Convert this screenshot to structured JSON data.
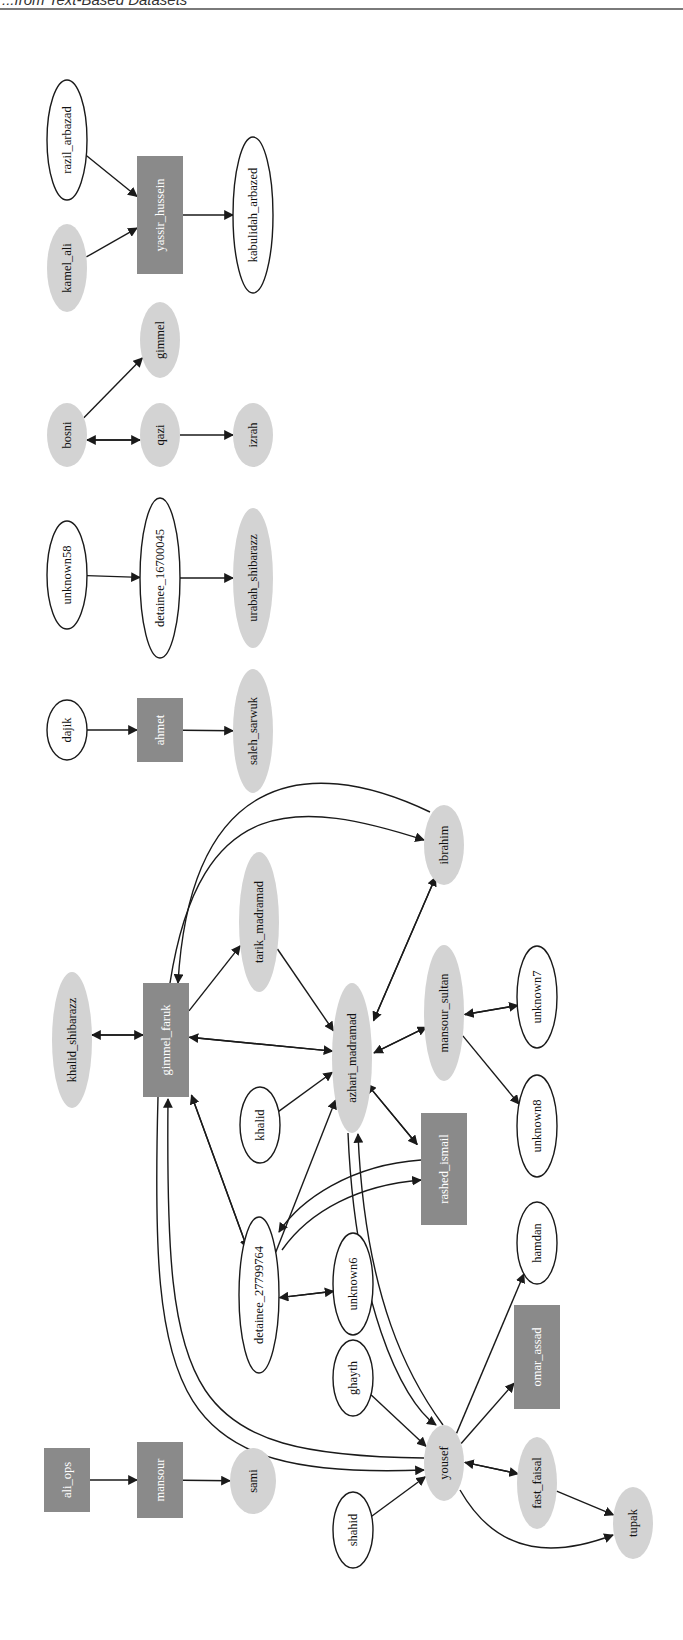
{
  "header": {
    "title": "...from Text-Based Datasets"
  },
  "colors": {
    "box_fill": "#8a8a8a",
    "box_text": "#ffffff",
    "gray_ellipse_fill": "#d3d3d3",
    "white_ellipse_fill": "#ffffff",
    "stroke": "#1a1a1a",
    "text": "#111111"
  },
  "graph": {
    "orientation": "rotated-90-ccw",
    "node_shapes_legend": {
      "box": "dark gray rectangle, white label",
      "gray": "light gray filled ellipse",
      "white": "white ellipse with black outline"
    },
    "nodes": [
      {
        "id": "ali_ops",
        "label": "ali_ops",
        "shape": "box",
        "x": 67,
        "y": 1480,
        "w": 46,
        "h": 64
      },
      {
        "id": "mansour",
        "label": "mansour",
        "shape": "box",
        "x": 160,
        "y": 1480,
        "w": 46,
        "h": 76
      },
      {
        "id": "sami",
        "label": "sami",
        "shape": "gray",
        "x": 253,
        "y": 1481,
        "rx": 23,
        "ry": 33
      },
      {
        "id": "shahid",
        "label": "shahid",
        "shape": "white",
        "x": 353,
        "y": 1530,
        "rx": 20,
        "ry": 38
      },
      {
        "id": "ghayth",
        "label": "ghayth",
        "shape": "white",
        "x": 353,
        "y": 1378,
        "rx": 20,
        "ry": 38
      },
      {
        "id": "yousef",
        "label": "yousef",
        "shape": "gray",
        "x": 444,
        "y": 1463,
        "rx": 20,
        "ry": 38
      },
      {
        "id": "fast_faisal",
        "label": "fast_faisal",
        "shape": "gray",
        "x": 537,
        "y": 1483,
        "rx": 20,
        "ry": 46
      },
      {
        "id": "tupak",
        "label": "tupak",
        "shape": "gray",
        "x": 633,
        "y": 1523,
        "rx": 20,
        "ry": 36
      },
      {
        "id": "omar_assad",
        "label": "omar_assad",
        "shape": "box",
        "x": 537,
        "y": 1357,
        "w": 46,
        "h": 104
      },
      {
        "id": "hamdan",
        "label": "hamdan",
        "shape": "white",
        "x": 537,
        "y": 1243,
        "rx": 20,
        "ry": 41
      },
      {
        "id": "detainee_27799764",
        "label": "detainee_27799764",
        "shape": "white",
        "x": 259,
        "y": 1295,
        "rx": 20,
        "ry": 78
      },
      {
        "id": "unknown6",
        "label": "unknown6",
        "shape": "white",
        "x": 353,
        "y": 1284,
        "rx": 20,
        "ry": 51
      },
      {
        "id": "khalid",
        "label": "khalid",
        "shape": "white",
        "x": 260,
        "y": 1125,
        "rx": 20,
        "ry": 38
      },
      {
        "id": "azhari_madramad",
        "label": "azhari_madramad",
        "shape": "gray",
        "x": 352,
        "y": 1058,
        "rx": 20,
        "ry": 75
      },
      {
        "id": "rashed_ismail",
        "label": "rashed_ismail",
        "shape": "box",
        "x": 444,
        "y": 1169,
        "w": 46,
        "h": 112
      },
      {
        "id": "mansour_sultan",
        "label": "mansour_sultan",
        "shape": "gray",
        "x": 444,
        "y": 1013,
        "rx": 20,
        "ry": 68
      },
      {
        "id": "unknown7",
        "label": "unknown7",
        "shape": "white",
        "x": 537,
        "y": 997,
        "rx": 20,
        "ry": 51
      },
      {
        "id": "unknown8",
        "label": "unknown8",
        "shape": "white",
        "x": 537,
        "y": 1126,
        "rx": 20,
        "ry": 51
      },
      {
        "id": "ibrahim",
        "label": "ibrahim",
        "shape": "gray",
        "x": 444,
        "y": 845,
        "rx": 20,
        "ry": 40
      },
      {
        "id": "tarik_madramad",
        "label": "tarik_madramad",
        "shape": "gray",
        "x": 259,
        "y": 922,
        "rx": 20,
        "ry": 70
      },
      {
        "id": "gimmel_faruk",
        "label": "gimmel_faruk",
        "shape": "box",
        "x": 166,
        "y": 1040,
        "w": 46,
        "h": 114
      },
      {
        "id": "khalid_shibarazz",
        "label": "khalid_shibarazz",
        "shape": "gray",
        "x": 72,
        "y": 1040,
        "rx": 20,
        "ry": 68
      },
      {
        "id": "dajik",
        "label": "dajik",
        "shape": "white",
        "x": 67,
        "y": 730,
        "rx": 20,
        "ry": 30
      },
      {
        "id": "ahmet",
        "label": "ahmet",
        "shape": "box",
        "x": 160,
        "y": 730,
        "w": 46,
        "h": 64
      },
      {
        "id": "saleh_sarwuk",
        "label": "saleh_sarwuk",
        "shape": "gray",
        "x": 253,
        "y": 731,
        "rx": 20,
        "ry": 62
      },
      {
        "id": "unknown58",
        "label": "unknown58",
        "shape": "white",
        "x": 67,
        "y": 575,
        "rx": 20,
        "ry": 54
      },
      {
        "id": "detainee_16700045",
        "label": "detainee_16700045",
        "shape": "white",
        "x": 160,
        "y": 578,
        "rx": 20,
        "ry": 80
      },
      {
        "id": "urabah_shibarazz",
        "label": "urabah_shibarazz",
        "shape": "gray",
        "x": 253,
        "y": 578,
        "rx": 20,
        "ry": 70
      },
      {
        "id": "bosni",
        "label": "bosni",
        "shape": "gray",
        "x": 67,
        "y": 435,
        "rx": 20,
        "ry": 32
      },
      {
        "id": "qazi",
        "label": "qazi",
        "shape": "gray",
        "x": 160,
        "y": 435,
        "rx": 20,
        "ry": 32
      },
      {
        "id": "izrah",
        "label": "izrah",
        "shape": "gray",
        "x": 253,
        "y": 435,
        "rx": 20,
        "ry": 32
      },
      {
        "id": "gimmel",
        "label": "gimmel",
        "shape": "gray",
        "x": 160,
        "y": 340,
        "rx": 20,
        "ry": 38
      },
      {
        "id": "kamel_ali",
        "label": "kamel_ali",
        "shape": "gray",
        "x": 67,
        "y": 268,
        "rx": 20,
        "ry": 44
      },
      {
        "id": "razil_arbazad",
        "label": "razil_arbazad",
        "shape": "white",
        "x": 67,
        "y": 140,
        "rx": 20,
        "ry": 60
      },
      {
        "id": "yassir_hussein",
        "label": "yassir_hussein",
        "shape": "box",
        "x": 160,
        "y": 215,
        "w": 46,
        "h": 118
      },
      {
        "id": "kabulidah_arbazed",
        "label": "kabulidah_arbazed",
        "shape": "white",
        "x": 253,
        "y": 215,
        "rx": 20,
        "ry": 78
      }
    ],
    "edges": [
      {
        "from": "ali_ops",
        "to": "mansour"
      },
      {
        "from": "mansour",
        "to": "sami"
      },
      {
        "from": "shahid",
        "to": "yousef"
      },
      {
        "from": "ghayth",
        "to": "yousef"
      },
      {
        "from": "yousef",
        "to": "fast_faisal"
      },
      {
        "from": "fast_faisal",
        "to": "yousef"
      },
      {
        "from": "fast_faisal",
        "to": "tupak"
      },
      {
        "from": "yousef",
        "to": "tupak"
      },
      {
        "from": "yousef",
        "to": "omar_assad"
      },
      {
        "from": "yousef",
        "to": "hamdan"
      },
      {
        "from": "gimmel_faruk",
        "to": "yousef"
      },
      {
        "from": "yousef",
        "to": "gimmel_faruk"
      },
      {
        "from": "azhari_madramad",
        "to": "yousef"
      },
      {
        "from": "yousef",
        "to": "azhari_madramad"
      },
      {
        "from": "detainee_27799764",
        "to": "unknown6"
      },
      {
        "from": "unknown6",
        "to": "detainee_27799764"
      },
      {
        "from": "detainee_27799764",
        "to": "azhari_madramad"
      },
      {
        "from": "gimmel_faruk",
        "to": "detainee_27799764"
      },
      {
        "from": "detainee_27799764",
        "to": "gimmel_faruk"
      },
      {
        "from": "rashed_ismail",
        "to": "detainee_27799764"
      },
      {
        "from": "detainee_27799764",
        "to": "rashed_ismail"
      },
      {
        "from": "khalid",
        "to": "azhari_madramad"
      },
      {
        "from": "azhari_madramad",
        "to": "rashed_ismail"
      },
      {
        "from": "rashed_ismail",
        "to": "azhari_madramad"
      },
      {
        "from": "azhari_madramad",
        "to": "mansour_sultan"
      },
      {
        "from": "mansour_sultan",
        "to": "azhari_madramad"
      },
      {
        "from": "mansour_sultan",
        "to": "unknown7"
      },
      {
        "from": "unknown7",
        "to": "mansour_sultan"
      },
      {
        "from": "mansour_sultan",
        "to": "unknown8"
      },
      {
        "from": "azhari_madramad",
        "to": "ibrahim"
      },
      {
        "from": "ibrahim",
        "to": "azhari_madramad"
      },
      {
        "from": "gimmel_faruk",
        "to": "ibrahim"
      },
      {
        "from": "ibrahim",
        "to": "gimmel_faruk"
      },
      {
        "from": "gimmel_faruk",
        "to": "tarik_madramad"
      },
      {
        "from": "tarik_madramad",
        "to": "azhari_madramad"
      },
      {
        "from": "gimmel_faruk",
        "to": "azhari_madramad"
      },
      {
        "from": "azhari_madramad",
        "to": "gimmel_faruk"
      },
      {
        "from": "gimmel_faruk",
        "to": "khalid_shibarazz"
      },
      {
        "from": "khalid_shibarazz",
        "to": "gimmel_faruk"
      },
      {
        "from": "dajik",
        "to": "ahmet"
      },
      {
        "from": "ahmet",
        "to": "saleh_sarwuk"
      },
      {
        "from": "unknown58",
        "to": "detainee_16700045"
      },
      {
        "from": "detainee_16700045",
        "to": "urabah_shibarazz"
      },
      {
        "from": "bosni",
        "to": "qazi"
      },
      {
        "from": "qazi",
        "to": "bosni"
      },
      {
        "from": "qazi",
        "to": "izrah"
      },
      {
        "from": "bosni",
        "to": "gimmel"
      },
      {
        "from": "kamel_ali",
        "to": "yassir_hussein"
      },
      {
        "from": "razil_arbazad",
        "to": "yassir_hussein"
      },
      {
        "from": "yassir_hussein",
        "to": "kabulidah_arbazed"
      }
    ]
  }
}
